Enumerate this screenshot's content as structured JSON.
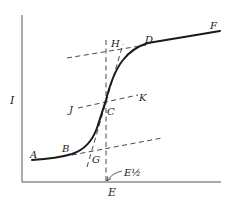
{
  "figure": {
    "axes": {
      "y_label": "I",
      "x_label": "E"
    },
    "points": {
      "A": "A",
      "B": "B",
      "C": "C",
      "D": "D",
      "F": "F",
      "G": "G",
      "H": "H",
      "J": "J",
      "K": "K"
    },
    "half_wave_label": "E½",
    "colors": {
      "curve": "#1a1a1a",
      "dashed": "#333333",
      "axis": "#444444",
      "background": "#ffffff"
    }
  }
}
